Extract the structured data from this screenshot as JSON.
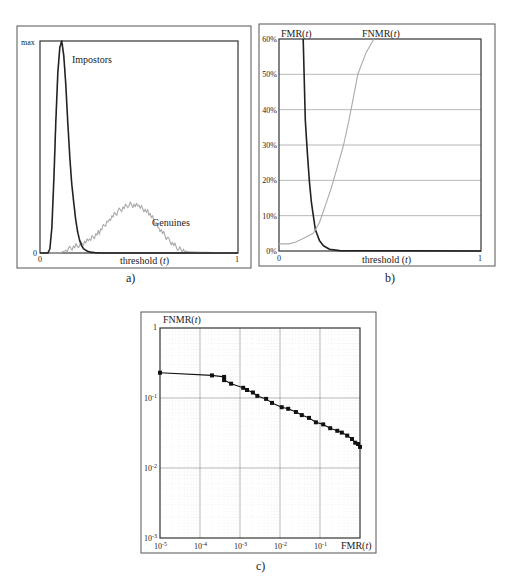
{
  "chart_data": [
    {
      "id": "a",
      "caption": "a)",
      "type": "line",
      "title": "",
      "xlabel": "threshold (t)",
      "ylabel": "",
      "x_ticks": [
        "0",
        "1"
      ],
      "y_ticks": [
        "0",
        "max"
      ],
      "xlim": [
        0,
        1
      ],
      "ylim": [
        0,
        1
      ],
      "grid": false,
      "series": [
        {
          "name": "Impostors",
          "color": "#222222",
          "x": [
            0.0,
            0.04,
            0.05,
            0.06,
            0.07,
            0.08,
            0.09,
            0.1,
            0.11,
            0.12,
            0.13,
            0.14,
            0.15,
            0.16,
            0.17,
            0.18,
            0.19,
            0.2,
            0.21,
            0.22,
            0.24,
            0.26,
            0.3,
            1.0
          ],
          "y": [
            0.0,
            0.0,
            0.02,
            0.12,
            0.35,
            0.62,
            0.85,
            0.97,
            1.0,
            0.93,
            0.8,
            0.62,
            0.46,
            0.33,
            0.24,
            0.16,
            0.1,
            0.06,
            0.035,
            0.02,
            0.008,
            0.003,
            0.0,
            0.0
          ]
        },
        {
          "name": "Genuines",
          "color": "#aaaaaa",
          "x": [
            0.0,
            0.1,
            0.15,
            0.2,
            0.25,
            0.3,
            0.35,
            0.4,
            0.45,
            0.5,
            0.55,
            0.6,
            0.65,
            0.7,
            0.75,
            1.0
          ],
          "y": [
            0.0,
            0.0,
            0.02,
            0.04,
            0.06,
            0.1,
            0.16,
            0.2,
            0.23,
            0.22,
            0.19,
            0.12,
            0.06,
            0.02,
            0.005,
            0.0
          ]
        }
      ],
      "annotations": [
        "Impostors",
        "Genuines"
      ]
    },
    {
      "id": "b",
      "caption": "b)",
      "type": "line",
      "title": "",
      "xlabel": "threshold (t)",
      "ylabel": "",
      "x_ticks": [
        "0",
        "1"
      ],
      "y_ticks": [
        "0%",
        "10%",
        "20%",
        "30%",
        "40%",
        "50%",
        "60%"
      ],
      "xlim": [
        0,
        1
      ],
      "ylim": [
        0,
        60
      ],
      "grid": true,
      "series": [
        {
          "name": "FMR(t)",
          "color": "#222222",
          "x": [
            0.12,
            0.125,
            0.13,
            0.14,
            0.15,
            0.16,
            0.17,
            0.18,
            0.2,
            0.22,
            0.25,
            0.3,
            1.0
          ],
          "y": [
            60,
            48,
            37,
            28,
            20,
            14,
            10,
            6,
            3,
            1.5,
            0.5,
            0.1,
            0.0
          ],
          "label": "FMR(t)"
        },
        {
          "name": "FNMR(t)",
          "color": "#aaaaaa",
          "x": [
            0.0,
            0.05,
            0.08,
            0.12,
            0.17,
            0.2,
            0.23,
            0.26,
            0.29,
            0.32,
            0.35,
            0.39,
            0.43,
            0.47
          ],
          "y": [
            2,
            2,
            2.5,
            3.5,
            5,
            8,
            13,
            18,
            24,
            30,
            38,
            50,
            56,
            60
          ],
          "label": "FNMR(t)"
        }
      ]
    },
    {
      "id": "c",
      "caption": "c)",
      "type": "line",
      "scale": "log-log",
      "title": "",
      "xlabel": "FMR(t)",
      "ylabel": "FNMR(t)",
      "x_ticks": [
        "10-5",
        "10-4",
        "10-3",
        "10-2",
        "10-1"
      ],
      "y_ticks": [
        "10-3",
        "10-2",
        "10-1",
        "1"
      ],
      "xlim": [
        1e-05,
        1
      ],
      "ylim": [
        0.001,
        1
      ],
      "grid": true,
      "series": [
        {
          "name": "ROC (DET)",
          "color": "#111111",
          "marker": "square",
          "x": [
            1e-05,
            0.0002,
            0.0004,
            0.0004,
            0.0006,
            0.0012,
            0.0015,
            0.0021,
            0.0027,
            0.0045,
            0.0063,
            0.011,
            0.016,
            0.025,
            0.035,
            0.053,
            0.079,
            0.12,
            0.18,
            0.27,
            0.35,
            0.48,
            0.63,
            0.76,
            0.89,
            1.0
          ],
          "y": [
            0.23,
            0.21,
            0.2,
            0.18,
            0.16,
            0.14,
            0.13,
            0.12,
            0.107,
            0.097,
            0.085,
            0.074,
            0.07,
            0.063,
            0.057,
            0.052,
            0.045,
            0.042,
            0.037,
            0.034,
            0.032,
            0.029,
            0.026,
            0.023,
            0.022,
            0.02
          ]
        }
      ]
    }
  ],
  "panels": {
    "a": {
      "caption": "a)",
      "y_max_label": "max",
      "y_zero_label": "0",
      "x_zero_label": "0",
      "x_one_label": "1",
      "xlabel_text": "threshold (",
      "xlabel_var": "t",
      "xlabel_close": ")",
      "impostors_label": "Impostors",
      "genuines_label": "Genuines"
    },
    "b": {
      "caption": "b)",
      "fmr_label_text": "FMR(",
      "fnmr_label_text": "FNMR(",
      "var": "t",
      "close": ")",
      "y_ticks": [
        "0%",
        "10%",
        "20%",
        "30%",
        "40%",
        "50%",
        "60%"
      ],
      "x_zero_label": "0",
      "x_one_label": "1",
      "xlabel_text": "threshold (",
      "xlabel_var": "t",
      "xlabel_close": ")"
    },
    "c": {
      "caption": "c)",
      "ylabel_text": "FNMR(",
      "xlabel_text": "FMR(",
      "var": "t",
      "close": ")",
      "y_one_label": "1",
      "y_exp_base": "10",
      "y_exps": [
        "-1",
        "-2",
        "-3"
      ],
      "x_exp_base": "10",
      "x_exps": [
        "-5",
        "-4",
        "-3",
        "-2",
        "-1"
      ]
    }
  }
}
